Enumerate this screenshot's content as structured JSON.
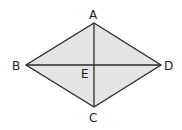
{
  "diagram": {
    "type": "rhombus-with-diagonals",
    "fill_color": "#e4e4e4",
    "stroke_color": "#2a2a2a",
    "vertices": {
      "A": {
        "label": "A",
        "x": 94,
        "y": 23
      },
      "B": {
        "label": "B",
        "x": 26,
        "y": 65
      },
      "C": {
        "label": "C",
        "x": 94,
        "y": 107
      },
      "D": {
        "label": "D",
        "x": 161,
        "y": 65
      }
    },
    "intersection": {
      "label": "E",
      "x": 94,
      "y": 65
    },
    "diagonals": [
      "AC",
      "BD"
    ]
  }
}
